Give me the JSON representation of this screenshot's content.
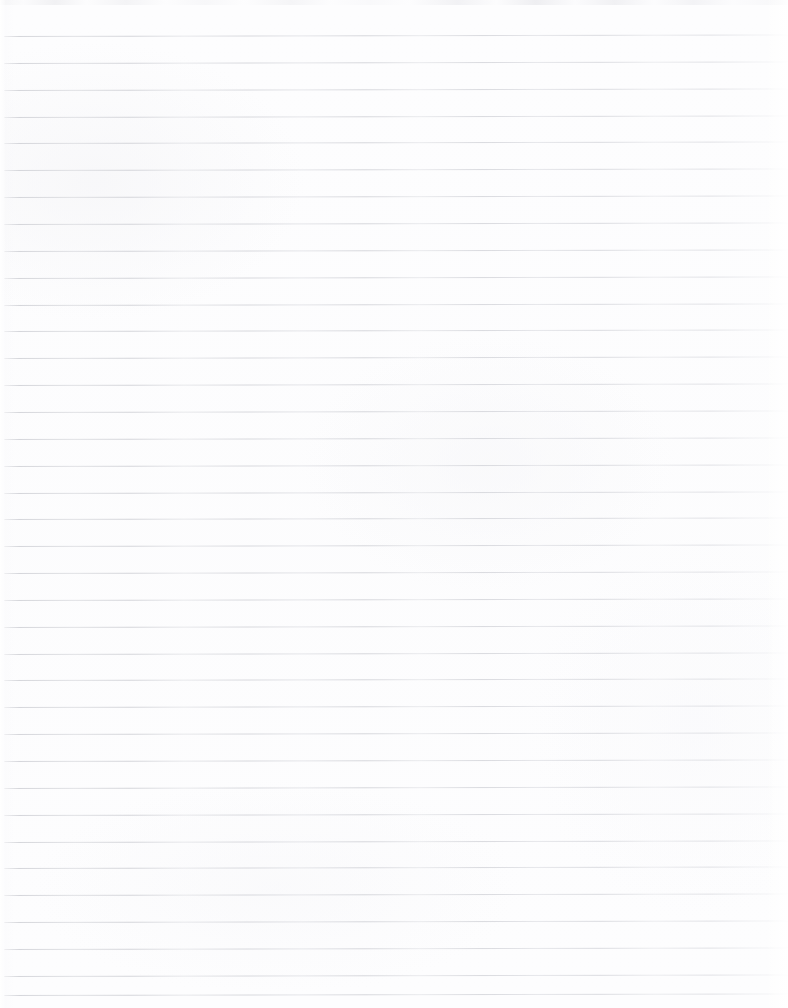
{
  "document": {
    "type": "scanned-lined-paper",
    "title": "Blank Lined Paper",
    "content_text": "",
    "page_label": "",
    "has_handwriting": false,
    "has_printed_text": false,
    "width_px": 788,
    "height_px": 1008
  },
  "paper": {
    "background_color": "#fdfdfe",
    "rule_color": "#d9dadd",
    "rule_thickness_px": 1,
    "rule_spacing_px": 26.85,
    "first_rule_y_px": 36,
    "last_rule_y_px": 995,
    "rule_left_x_px": 4,
    "rule_right_x_px": 788,
    "rule_count": 36,
    "skew_degrees": -0.11,
    "margin_rule": "none",
    "scan_edge_top_color": "#ededf0",
    "scan_edge_top_height_px": 5
  },
  "rules": [
    {
      "index": 1,
      "y": 36
    },
    {
      "index": 2,
      "y": 62.9
    },
    {
      "index": 3,
      "y": 89.7
    },
    {
      "index": 4,
      "y": 116.6
    },
    {
      "index": 5,
      "y": 143.4
    },
    {
      "index": 6,
      "y": 170.3
    },
    {
      "index": 7,
      "y": 197.1
    },
    {
      "index": 8,
      "y": 224
    },
    {
      "index": 9,
      "y": 250.8
    },
    {
      "index": 10,
      "y": 277.7
    },
    {
      "index": 11,
      "y": 304.5
    },
    {
      "index": 12,
      "y": 331.4
    },
    {
      "index": 13,
      "y": 358.2
    },
    {
      "index": 14,
      "y": 385.1
    },
    {
      "index": 15,
      "y": 411.9
    },
    {
      "index": 16,
      "y": 438.8
    },
    {
      "index": 17,
      "y": 465.6
    },
    {
      "index": 18,
      "y": 492.5
    },
    {
      "index": 19,
      "y": 519.3
    },
    {
      "index": 20,
      "y": 546.2
    },
    {
      "index": 21,
      "y": 573
    },
    {
      "index": 22,
      "y": 599.9
    },
    {
      "index": 23,
      "y": 626.7
    },
    {
      "index": 24,
      "y": 653.6
    },
    {
      "index": 25,
      "y": 680.4
    },
    {
      "index": 26,
      "y": 707.3
    },
    {
      "index": 27,
      "y": 734.1
    },
    {
      "index": 28,
      "y": 761
    },
    {
      "index": 29,
      "y": 787.8
    },
    {
      "index": 30,
      "y": 814.7
    },
    {
      "index": 31,
      "y": 841.5
    },
    {
      "index": 32,
      "y": 868.4
    },
    {
      "index": 33,
      "y": 895.2
    },
    {
      "index": 34,
      "y": 922.1
    },
    {
      "index": 35,
      "y": 948.9
    },
    {
      "index": 36,
      "y": 975.8
    },
    {
      "index": 37,
      "y": 995
    }
  ]
}
